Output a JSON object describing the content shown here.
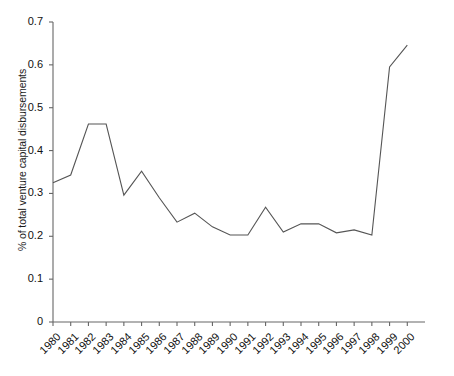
{
  "chart_data": {
    "type": "line",
    "title": "",
    "xlabel": "",
    "ylabel": "% of total venture capital disbursements",
    "categories": [
      "1980",
      "1981",
      "1982",
      "1983",
      "1984",
      "1985",
      "1986",
      "1987",
      "1988",
      "1989",
      "1990",
      "1991",
      "1992",
      "1993",
      "1994",
      "1995",
      "1996",
      "1997",
      "1998",
      "1999",
      "2000"
    ],
    "values": [
      0.325,
      0.343,
      0.462,
      0.462,
      0.296,
      0.352,
      0.29,
      0.233,
      0.254,
      0.222,
      0.203,
      0.203,
      0.268,
      0.21,
      0.229,
      0.229,
      0.208,
      0.215,
      0.203,
      0.595,
      0.646
    ],
    "series": [
      {
        "name": "% of total venture capital disbursements",
        "values": [
          0.325,
          0.343,
          0.462,
          0.462,
          0.296,
          0.352,
          0.29,
          0.233,
          0.254,
          0.222,
          0.203,
          0.203,
          0.268,
          0.21,
          0.229,
          0.229,
          0.208,
          0.215,
          0.203,
          0.595,
          0.646
        ]
      }
    ],
    "ylim": [
      0,
      0.7
    ],
    "xlim": [
      "1980",
      "2000"
    ],
    "ytick_labels": [
      "0",
      "0.1",
      "0.2",
      "0.3",
      "0.4",
      "0.5",
      "0.6",
      "0.7"
    ],
    "ytick_values": [
      0,
      0.1,
      0.2,
      0.3,
      0.4,
      0.5,
      0.6,
      0.7
    ],
    "xtick_labels": [
      "1980",
      "1981",
      "1982",
      "1983",
      "1984",
      "1985",
      "1986",
      "1987",
      "1988",
      "1989",
      "1990",
      "1991",
      "1992",
      "1993",
      "1994",
      "1995",
      "1996",
      "1997",
      "1998",
      "1999",
      "2000"
    ],
    "grid": false,
    "legend": "none",
    "line_color": "#555555",
    "axis_color": "#666666",
    "background_color": "#ffffff",
    "markers": false,
    "annotations": []
  }
}
